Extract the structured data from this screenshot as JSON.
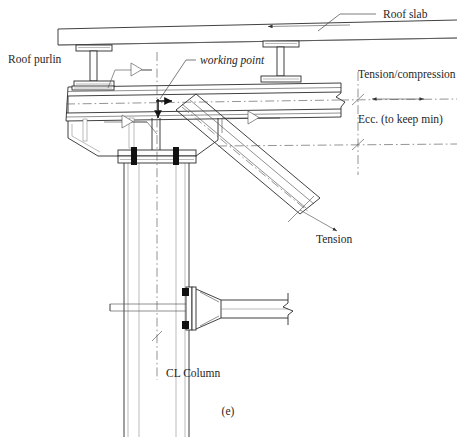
{
  "figure": {
    "caption": "(e)",
    "type": "structural-steel-connection-detail",
    "title_labels": {
      "roof_slab": "Roof slab",
      "roof_purlin": "Roof purlin",
      "working_point": "working point",
      "tension_compression": "Tension/compression",
      "eccentricity": "Ecc. (to keep min)",
      "tension": "Tension",
      "cl_column": "CL Column"
    },
    "annotations": [
      {
        "id": "roof-slab",
        "text": "Roof slab",
        "leader": true
      },
      {
        "id": "roof-purlin",
        "text": "Roof purlin",
        "leader": false
      },
      {
        "id": "working-point",
        "text": "working point",
        "leader": true,
        "style": "italic"
      },
      {
        "id": "tension-compression",
        "text": "Tension/compression",
        "arrow": "double-horizontal"
      },
      {
        "id": "eccentricity",
        "text": "Ecc. (to keep min)",
        "arrow": "vertical-dimension"
      },
      {
        "id": "tension",
        "text": "Tension",
        "arrow": "single-diagonal"
      },
      {
        "id": "cl-column",
        "text": "CL Column",
        "arrow": "centerline"
      }
    ],
    "weld_symbols": [
      {
        "id": "weld-top-chord",
        "symbol": "fillet-weld-triangle"
      },
      {
        "id": "weld-gusset",
        "symbol": "fillet-weld-triangle"
      },
      {
        "id": "weld-brace",
        "symbol": "fillet-weld-triangle"
      }
    ],
    "members": [
      {
        "id": "roof-slab",
        "name": "Roof slab"
      },
      {
        "id": "purlin-left",
        "name": "Roof purlin I-section"
      },
      {
        "id": "purlin-right",
        "name": "Roof purlin I-section"
      },
      {
        "id": "top-chord",
        "name": "Top chord / rafter"
      },
      {
        "id": "gusset-plate",
        "name": "Gusset plate"
      },
      {
        "id": "diagonal-brace",
        "name": "Diagonal brace (tension)"
      },
      {
        "id": "column",
        "name": "Column"
      },
      {
        "id": "splice-plate",
        "name": "Bolted splice plate"
      },
      {
        "id": "haunched-beam",
        "name": "Haunched beam"
      }
    ],
    "colors": {
      "line": "#2b2b2b",
      "thin_line": "#555555",
      "centerline": "#666666",
      "arrow_fill": "#111111",
      "background": "#ffffff"
    }
  }
}
